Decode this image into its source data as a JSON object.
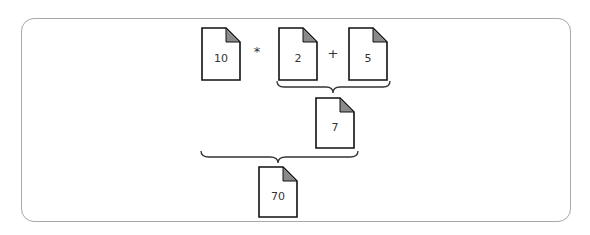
{
  "diagram": {
    "documents": [
      {
        "id": "doc-10",
        "label": "10"
      },
      {
        "id": "doc-2",
        "label": "2"
      },
      {
        "id": "doc-5",
        "label": "5"
      },
      {
        "id": "doc-7",
        "label": "7"
      },
      {
        "id": "doc-70",
        "label": "70"
      }
    ],
    "operators": [
      {
        "id": "multiply",
        "symbol": "*"
      },
      {
        "id": "plus",
        "symbol": "+"
      }
    ],
    "colors": {
      "document_fill": "#ffffff",
      "document_stroke": "#111111",
      "fold_fill": "#8a8a8a",
      "frame_stroke": "#a8a8a8",
      "brace_stroke": "#333333"
    }
  }
}
